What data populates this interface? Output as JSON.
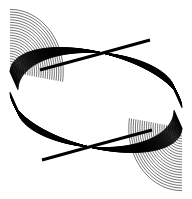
{
  "figure": {
    "width": 192,
    "height": 199,
    "background": "#ffffff",
    "stroke_color": "#000000",
    "center": [
      96,
      100
    ],
    "line_count": 60,
    "stroke_width": 0.55
  }
}
